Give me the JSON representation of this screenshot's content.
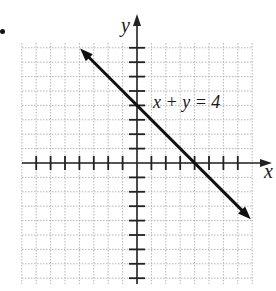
{
  "problem": {
    "bullet": "•"
  },
  "chart_data": {
    "type": "line",
    "title": "",
    "xlabel": "x",
    "ylabel": "y",
    "grid": true,
    "xlim": [
      -8,
      8
    ],
    "ylim": [
      -8,
      8
    ],
    "series": [
      {
        "name": "x + y = 4",
        "equation": "x + y = 4",
        "x": [
          -4,
          0,
          4,
          8
        ],
        "y": [
          8,
          4,
          0,
          -4
        ]
      }
    ],
    "annotations": [
      {
        "text": "x + y = 4",
        "x": 1,
        "y": 4
      }
    ]
  },
  "labels": {
    "x_axis": "x",
    "y_axis": "y",
    "equation": "x + y = 4"
  },
  "layout": {
    "origin_px": [
      137,
      163
    ],
    "unit_px": 14.4,
    "grid_left": 22,
    "grid_right": 253,
    "grid_top": 43,
    "grid_bottom": 284,
    "line_color": "#111111",
    "grid_color": "#b5b5b5"
  }
}
